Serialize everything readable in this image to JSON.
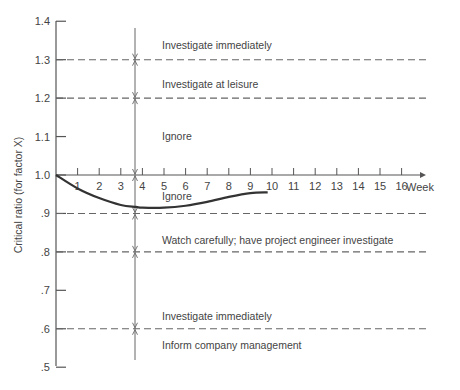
{
  "chart_data": {
    "type": "line",
    "title": "",
    "xlabel": "Week",
    "ylabel": "Critical ratio (for factor X)",
    "xlim": [
      0,
      17
    ],
    "ylim": [
      0.5,
      1.4
    ],
    "x_ticks": [
      "1",
      "2",
      "3",
      "4",
      "5",
      "6",
      "7",
      "8",
      "9",
      "10",
      "11",
      "12",
      "13",
      "14",
      "15",
      "16"
    ],
    "y_ticks": [
      {
        "value": 1.4,
        "label": "1.4"
      },
      {
        "value": 1.3,
        "label": "1.3"
      },
      {
        "value": 1.2,
        "label": "1.2"
      },
      {
        "value": 1.1,
        "label": "1.1"
      },
      {
        "value": 1.0,
        "label": "1.0"
      },
      {
        "value": 0.9,
        "label": ".9"
      },
      {
        "value": 0.8,
        "label": ".8"
      },
      {
        "value": 0.7,
        "label": ".7"
      },
      {
        "value": 0.6,
        "label": ".6"
      },
      {
        "value": 0.5,
        "label": ".5"
      }
    ],
    "grid": false,
    "series": [
      {
        "name": "Critical ratio",
        "x": [
          0,
          1,
          2,
          3,
          3.7,
          4,
          5,
          6,
          7,
          8,
          9,
          9.8
        ],
        "values": [
          1.0,
          0.965,
          0.94,
          0.922,
          0.917,
          0.915,
          0.915,
          0.92,
          0.93,
          0.943,
          0.953,
          0.955
        ]
      }
    ],
    "threshold_lines": [
      {
        "value": 1.3,
        "style": "dashed"
      },
      {
        "value": 1.2,
        "style": "dashed"
      },
      {
        "value": 0.9,
        "style": "dashed"
      },
      {
        "value": 0.8,
        "style": "dashed"
      },
      {
        "value": 0.6,
        "style": "dashed"
      }
    ],
    "region_labels": [
      {
        "text": "Investigate immediately",
        "y": 1.33
      },
      {
        "text": "Investigate at leisure",
        "y": 1.23
      },
      {
        "text": "Ignore",
        "y": 1.1
      },
      {
        "text": "Ignore",
        "y": 0.95
      },
      {
        "text": "Watch carefully; have project engineer investigate",
        "y": 0.83
      },
      {
        "text": "Investigate immediately",
        "y": 0.63
      },
      {
        "text": "Inform company management",
        "y": 0.55
      }
    ],
    "reference_vertical_line": {
      "x": 3.7,
      "y_range": [
        0.52,
        1.45
      ]
    }
  }
}
